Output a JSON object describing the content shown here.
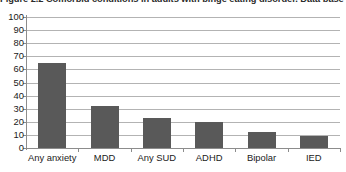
{
  "figure": {
    "caption": "Figure 2.2  Comorbid conditions in adults with binge eating disorder. Data base"
  },
  "chart_data": {
    "type": "bar",
    "title": "Figure 2.2  Comorbid conditions in adults with binge eating disorder. Data base",
    "categories": [
      "Any anxiety",
      "MDD",
      "Any SUD",
      "ADHD",
      "Bipolar",
      "IED"
    ],
    "values": [
      65,
      32,
      23,
      20,
      12,
      9
    ],
    "xlabel": "",
    "ylabel": "",
    "ylim": [
      0,
      100
    ],
    "yticks": [
      0,
      10,
      20,
      30,
      40,
      50,
      60,
      70,
      80,
      90,
      100
    ],
    "ytick_labels": [
      "0",
      "10",
      "20",
      "30",
      "40",
      "50",
      "60",
      "70",
      "80",
      "90",
      "100"
    ],
    "grid": true,
    "grid_axis": "y",
    "legend": false,
    "bar_color": "#595959",
    "grid_color": "#b3b3b3",
    "axis_color": "#8c8c8c"
  }
}
